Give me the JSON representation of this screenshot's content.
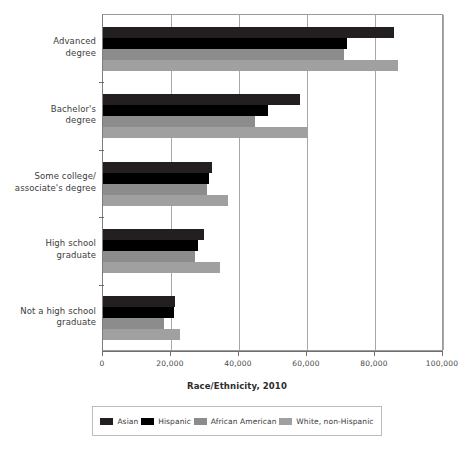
{
  "chart_data": {
    "type": "bar",
    "orientation": "horizontal",
    "title": "",
    "xlabel": "Race/Ethnicity, 2010",
    "ylabel": "",
    "xlim": [
      0,
      100000
    ],
    "ylim": null,
    "grid": true,
    "legend_position": "bottom",
    "categories": [
      "Advanced degree",
      "Bachelor's degree",
      "Some college/associate's degree",
      "High school graduate",
      "Not a high school graduate"
    ],
    "category_lines": [
      [
        "Advanced",
        "degree"
      ],
      [
        "Bachelor's",
        "degree"
      ],
      [
        "Some college/",
        "associate's degree"
      ],
      [
        "High school",
        "graduate"
      ],
      [
        "Not a high school",
        "graduate"
      ]
    ],
    "xticks": [
      0,
      20000,
      40000,
      60000,
      80000,
      100000
    ],
    "xtick_labels": [
      "0",
      "20,000",
      "40,000",
      "60,000",
      "80,000",
      "100,000"
    ],
    "series": [
      {
        "name": "Asian",
        "color": "#231f20",
        "values": [
          85500,
          58000,
          32000,
          29800,
          21200
        ]
      },
      {
        "name": "Hispanic",
        "color": "#000000",
        "values": [
          71800,
          48400,
          31300,
          28000,
          20800
        ]
      },
      {
        "name": "African American",
        "color": "#8c8c8c",
        "values": [
          71000,
          44700,
          30600,
          27000,
          18000
        ]
      },
      {
        "name": "White, non-Hispanic",
        "color": "#a0a0a0",
        "values": [
          86700,
          60200,
          36700,
          34500,
          22700
        ]
      }
    ]
  },
  "legend": {
    "items": [
      {
        "label": "Asian",
        "color": "#231f20"
      },
      {
        "label": "Hispanic",
        "color": "#000000"
      },
      {
        "label": "African American",
        "color": "#8c8c8c"
      },
      {
        "label": "White, non-Hispanic",
        "color": "#a0a0a0"
      }
    ]
  },
  "axis": {
    "x_title": "Race/Ethnicity, 2010"
  }
}
